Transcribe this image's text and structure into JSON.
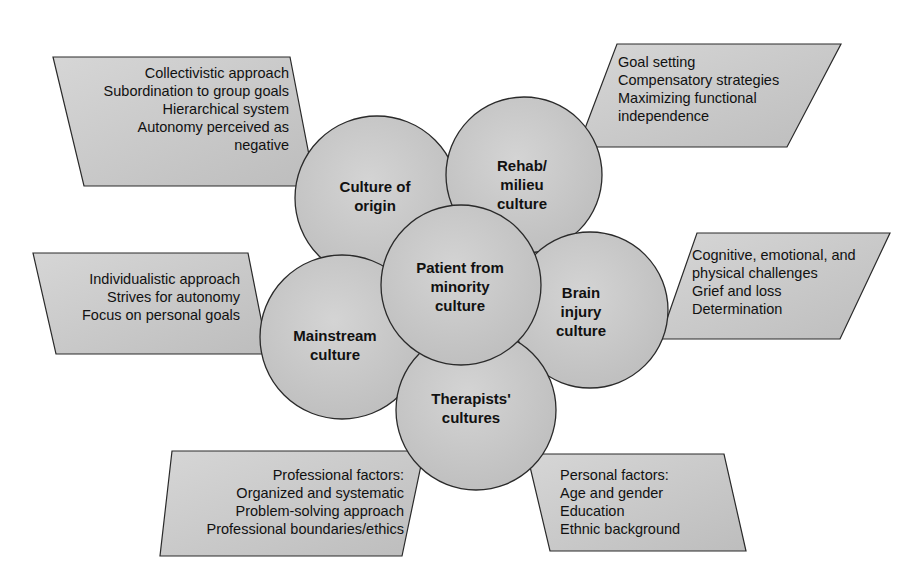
{
  "colors": {
    "fill": "#c9c9c9",
    "fill_light": "#d8d8d8",
    "stroke": "#2a2a2a",
    "text": "#111111",
    "background": "#ffffff"
  },
  "circles": [
    {
      "id": "culture-of-origin",
      "lines": [
        "Culture of",
        "origin"
      ]
    },
    {
      "id": "rehab-milieu-culture",
      "lines": [
        "Rehab/",
        "milieu",
        "culture"
      ]
    },
    {
      "id": "mainstream-culture",
      "lines": [
        "Mainstream",
        "culture"
      ]
    },
    {
      "id": "brain-injury-culture",
      "lines": [
        "Brain",
        "injury",
        "culture"
      ]
    },
    {
      "id": "therapists-cultures",
      "lines": [
        "Therapists'",
        "cultures"
      ]
    },
    {
      "id": "patient-from-minority-culture",
      "lines": [
        "Patient from",
        "minority",
        "culture"
      ]
    }
  ],
  "boxes": {
    "culture_of_origin": [
      "Collectivistic approach",
      "Subordination to group goals",
      "Hierarchical system",
      "Autonomy perceived as",
      "negative"
    ],
    "rehab_milieu": [
      "Goal setting",
      "Compensatory strategies",
      "Maximizing functional",
      "independence"
    ],
    "mainstream": [
      "Individualistic approach",
      "Strives for autonomy",
      "Focus on personal goals"
    ],
    "brain_injury": [
      "Cognitive, emotional, and",
      "physical challenges",
      "Grief and loss",
      "Determination"
    ],
    "professional": [
      "Professional factors:",
      "Organized and systematic",
      "Problem-solving approach",
      "Professional boundaries/ethics"
    ],
    "personal": [
      "Personal factors:",
      "Age and gender",
      "Education",
      "Ethnic background"
    ]
  }
}
